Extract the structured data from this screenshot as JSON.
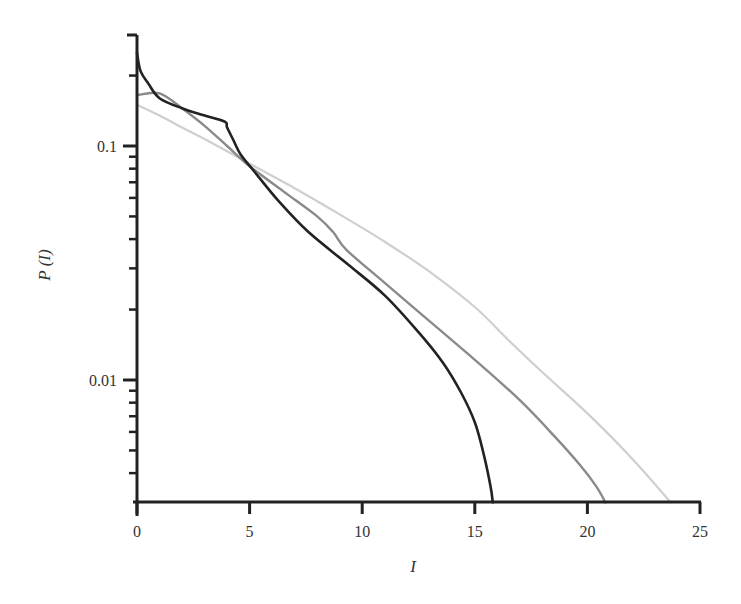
{
  "chart_data": {
    "type": "line",
    "title": "",
    "xlabel": "I",
    "ylabel": "P (I)",
    "xscale": "linear",
    "yscale": "log",
    "xlim": [
      0,
      25
    ],
    "ylim": [
      0.003,
      0.3
    ],
    "xticks": [
      0,
      5,
      10,
      15,
      20,
      25
    ],
    "xtick_labels": [
      "0",
      "5",
      "10",
      "15",
      "20",
      "25"
    ],
    "yticks_major": [
      0.01,
      0.1
    ],
    "ytick_labels": [
      "0.01",
      "0.1"
    ],
    "yticks_minor": [
      0.004,
      0.005,
      0.006,
      0.007,
      0.008,
      0.009,
      0.02,
      0.03,
      0.04,
      0.05,
      0.06,
      0.07,
      0.08,
      0.09,
      0.2,
      0.3
    ],
    "grid": false,
    "legend": null,
    "series": [
      {
        "name": "black",
        "color": "#222222",
        "width": 2.6,
        "x": [
          0.0,
          0.15,
          0.5,
          1.0,
          2.0,
          3.0,
          3.9,
          4.0,
          4.3,
          4.6,
          5.2,
          6.3,
          7.6,
          9.4,
          11.0,
          12.5,
          13.6,
          14.4,
          15.0,
          15.4,
          15.7,
          15.8
        ],
        "y": [
          0.25,
          0.21,
          0.185,
          0.16,
          0.145,
          0.135,
          0.127,
          0.12,
          0.105,
          0.092,
          0.078,
          0.058,
          0.043,
          0.031,
          0.023,
          0.016,
          0.0118,
          0.0088,
          0.0066,
          0.0048,
          0.0035,
          0.003
        ]
      },
      {
        "name": "mid-gray",
        "color": "#8a8a8a",
        "width": 2.4,
        "x": [
          0.0,
          1.0,
          2.0,
          3.0,
          4.0,
          5.0,
          6.5,
          8.0,
          8.7,
          9.3,
          11.0,
          13.0,
          15.0,
          17.0,
          18.5,
          19.7,
          20.4,
          20.8
        ],
        "y": [
          0.165,
          0.168,
          0.145,
          0.122,
          0.1,
          0.082,
          0.064,
          0.05,
          0.043,
          0.036,
          0.026,
          0.0178,
          0.0122,
          0.0082,
          0.0058,
          0.0043,
          0.0035,
          0.003
        ]
      },
      {
        "name": "light-gray",
        "color": "#cfcfcf",
        "width": 2.2,
        "x": [
          0.0,
          1.0,
          2.0,
          3.0,
          4.0,
          5.0,
          7.0,
          9.0,
          11.0,
          13.0,
          15.0,
          16.5,
          18.0,
          20.0,
          22.0,
          23.7
        ],
        "y": [
          0.15,
          0.135,
          0.12,
          0.107,
          0.095,
          0.084,
          0.066,
          0.051,
          0.039,
          0.029,
          0.0205,
          0.0148,
          0.0108,
          0.0072,
          0.0046,
          0.003
        ]
      }
    ]
  }
}
